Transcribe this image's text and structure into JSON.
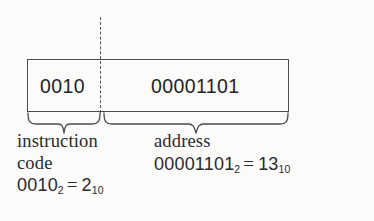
{
  "figure": {
    "box": {
      "fields": [
        {
          "name": "instruction-code-field",
          "bits": "0010",
          "width_bits": 4
        },
        {
          "name": "address-field",
          "bits": "00001101",
          "width_bits": 8
        }
      ]
    },
    "captions": [
      {
        "name": "instruction-code-caption",
        "line1": "instruction",
        "line2": "code",
        "value_binary": "0010",
        "base_binary": "2",
        "equals": "=",
        "value_decimal": "2",
        "base_decimal": "10"
      },
      {
        "name": "address-caption",
        "line1": "address",
        "line2": "",
        "value_binary": "00001101",
        "base_binary": "2",
        "equals": "=",
        "value_decimal": "13",
        "base_decimal": "10"
      }
    ],
    "colors": {
      "background": "#fbfbfa",
      "ink": "#2a2a2d",
      "rule": "#4a4b4f",
      "dashed_rule": "#55565a"
    }
  }
}
